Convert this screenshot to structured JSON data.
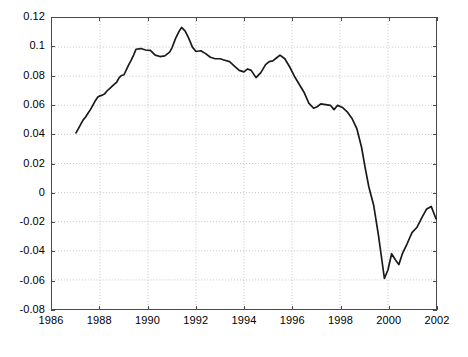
{
  "chart_data": {
    "type": "line",
    "title": "",
    "subtitle": "",
    "xlabel": "",
    "ylabel": "",
    "xlim": [
      1986,
      2002
    ],
    "ylim": [
      -0.08,
      0.12
    ],
    "grid": true,
    "grid_style": "dotted",
    "legend": null,
    "legend_position": "none",
    "line_color": "#1a1a1a",
    "background_color": "#ffffff",
    "axis_color": "#4a4a4a",
    "grid_color": "#b4b4b4",
    "xticks": [
      1986,
      1988,
      1990,
      1992,
      1994,
      1996,
      1998,
      2000,
      2002
    ],
    "xtick_labels": [
      "1986",
      "1988",
      "1990",
      "1992",
      "1994",
      "1996",
      "1998",
      "2000",
      "2002"
    ],
    "yticks": [
      -0.08,
      -0.06,
      -0.04,
      -0.02,
      0,
      0.02,
      0.04,
      0.06,
      0.08,
      0.1,
      0.12
    ],
    "ytick_labels": [
      "-0.08",
      "-0.06",
      "-0.04",
      "-0.02",
      "0",
      "0.02",
      "0.04",
      "0.06",
      "0.08",
      "0.1",
      "0.12"
    ],
    "annotations": [],
    "series": [
      {
        "name": "series-1",
        "color": "#1a1a1a",
        "x": [
          1987.0,
          1987.1,
          1987.2,
          1987.3,
          1987.4,
          1987.5,
          1987.6,
          1987.7,
          1987.8,
          1987.9,
          1988.0,
          1988.1,
          1988.2,
          1988.3,
          1988.4,
          1988.5,
          1988.6,
          1988.7,
          1988.8,
          1988.9,
          1989.0,
          1989.1,
          1989.2,
          1989.3,
          1989.4,
          1989.5,
          1989.7,
          1989.9,
          1990.1,
          1990.3,
          1990.5,
          1990.7,
          1990.9,
          1991.0,
          1991.15,
          1991.3,
          1991.4,
          1991.55,
          1991.7,
          1991.85,
          1992.0,
          1992.2,
          1992.4,
          1992.6,
          1992.8,
          1993.0,
          1993.2,
          1993.4,
          1993.6,
          1993.8,
          1994.0,
          1994.15,
          1994.3,
          1994.5,
          1994.7,
          1994.9,
          1995.05,
          1995.2,
          1995.35,
          1995.5,
          1995.7,
          1995.9,
          1996.1,
          1996.3,
          1996.5,
          1996.7,
          1996.9,
          1997.05,
          1997.2,
          1997.4,
          1997.6,
          1997.75,
          1997.9,
          1998.1,
          1998.3,
          1998.5,
          1998.7,
          1998.9,
          1999.05,
          1999.2,
          1999.4,
          1999.6,
          1999.75,
          1999.85,
          2000.0,
          2000.15,
          2000.3,
          2000.45,
          2000.6,
          2000.8,
          2001.0,
          2001.2,
          2001.4,
          2001.6,
          2001.8,
          2002.0
        ],
        "y": [
          0.041,
          0.044,
          0.047,
          0.05,
          0.052,
          0.0545,
          0.057,
          0.06,
          0.063,
          0.0655,
          0.0665,
          0.067,
          0.068,
          0.07,
          0.0715,
          0.073,
          0.0745,
          0.076,
          0.079,
          0.0805,
          0.081,
          0.0845,
          0.088,
          0.091,
          0.0945,
          0.0985,
          0.099,
          0.098,
          0.0978,
          0.0945,
          0.0935,
          0.094,
          0.0965,
          0.0995,
          0.106,
          0.111,
          0.1135,
          0.111,
          0.106,
          0.1,
          0.097,
          0.0975,
          0.0955,
          0.093,
          0.092,
          0.092,
          0.091,
          0.09,
          0.087,
          0.084,
          0.083,
          0.085,
          0.084,
          0.079,
          0.0825,
          0.088,
          0.09,
          0.0905,
          0.0925,
          0.0945,
          0.092,
          0.0865,
          0.08,
          0.0745,
          0.069,
          0.0615,
          0.058,
          0.059,
          0.061,
          0.0605,
          0.06,
          0.057,
          0.06,
          0.0585,
          0.0555,
          0.051,
          0.044,
          0.031,
          0.017,
          0.004,
          -0.0085,
          -0.029,
          -0.047,
          -0.059,
          -0.053,
          -0.042,
          -0.046,
          -0.0495,
          -0.042,
          -0.035,
          -0.0275,
          -0.024,
          -0.0175,
          -0.0115,
          -0.0095,
          -0.018
        ]
      }
    ]
  }
}
